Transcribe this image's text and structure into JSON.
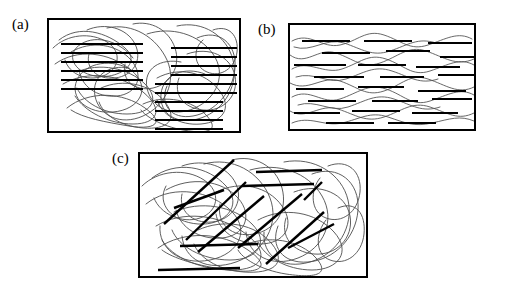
{
  "figure": {
    "background_color": "#ffffff",
    "matrix_color": "#4d4d4d",
    "fiber_color": "#000000",
    "frame_color": "#000000",
    "panels": [
      {
        "id": "a",
        "label": "(a)",
        "x": 47,
        "y": 18,
        "width": 194,
        "height": 115,
        "matrix_style": "random-coil",
        "fiber_style": "clustered-horizontal-bundles",
        "fiber_angle_deg": 0,
        "bundle_count": 3
      },
      {
        "id": "b",
        "label": "(b)",
        "x": 288,
        "y": 23,
        "width": 188,
        "height": 108,
        "matrix_style": "aligned-wavy",
        "fiber_style": "dispersed-horizontal-segments",
        "fiber_angle_deg": 0,
        "bundle_count": 0
      },
      {
        "id": "c",
        "label": "(c)",
        "x": 138,
        "y": 152,
        "width": 230,
        "height": 126,
        "matrix_style": "random-coil",
        "fiber_style": "randomly-oriented-segments",
        "fiber_angle_deg": null,
        "bundle_count": 0
      }
    ]
  },
  "chart_data": {
    "type": "diagram",
    "title": "",
    "panel_a": {
      "label": "(a)",
      "matrix_curves": [
        {
          "d": "M12,22 C32,6 60,14 78,30 C96,46 70,62 48,58 C26,54 18,36 34,26 C50,16 74,24 86,40"
        },
        {
          "d": "M8,46 C30,30 62,34 84,52 C106,70 92,92 66,94 C40,96 22,80 30,62 C38,44 66,40 84,52"
        },
        {
          "d": "M20,90 C42,72 76,74 98,90 C120,106 106,112 82,108 C58,104 36,100 24,92"
        },
        {
          "d": "M60,10 C86,4 110,20 120,42 C130,64 118,88 96,98 C74,108 52,98 48,78 C44,58 62,46 82,50"
        },
        {
          "d": "M100,16 C124,8 152,16 166,36 C180,56 170,80 148,90 C126,100 104,90 100,70 C96,50 114,40 134,44"
        },
        {
          "d": "M130,8 C156,2 180,18 186,42 C192,66 178,92 154,100 C130,108 112,96 114,76 C116,56 138,48 158,56"
        },
        {
          "d": "M150,20 C172,10 190,26 188,50 C186,74 168,94 146,98 C124,102 112,86 120,68"
        },
        {
          "d": "M16,66 C40,52 74,56 96,74 C118,92 110,106 86,106 C62,106 38,94 28,78"
        },
        {
          "d": "M86,6 C104,2 122,12 128,30 C134,48 124,66 106,70 C88,74 74,62 78,46"
        },
        {
          "d": "M40,12 C58,4 80,10 88,26 C96,42 86,58 68,60 C50,62 38,50 42,36"
        },
        {
          "d": "M110,60 C132,48 158,54 172,72 C186,90 176,104 154,106 C132,108 114,96 110,82"
        },
        {
          "d": "M24,34 C44,22 70,26 84,42 C98,58 90,76 70,78 C50,80 34,68 32,52"
        },
        {
          "d": "M140,36 C162,28 184,38 188,58 C192,78 176,94 156,92 C136,90 126,76 132,60"
        },
        {
          "d": "M54,70 C76,60 104,66 118,84 C132,102 120,112 96,110 C72,108 56,96 52,84"
        },
        {
          "d": "M6,30 C20,16 44,14 60,24 C76,34 72,52 56,58 C40,64 22,56 18,42"
        },
        {
          "d": "M96,86 C118,76 146,82 160,98 C174,114 158,116 136,112 C114,108 98,98 94,92"
        },
        {
          "d": "M166,12 C182,6 192,18 190,34 C188,50 174,60 160,54 C146,48 146,30 156,22"
        },
        {
          "d": "M30,54 C52,44 82,50 98,66 C114,82 104,96 80,96 C56,96 36,84 30,70"
        }
      ],
      "fiber_bundles": [
        {
          "x1": 14,
          "x2": 96,
          "y_start": 26,
          "y_step": 9,
          "count": 6,
          "note": "upper-left bundle"
        },
        {
          "x1": 108,
          "x2": 176,
          "y_start": 66,
          "y_step": 9,
          "count": 6,
          "note": "lower-center bundle"
        },
        {
          "x1": 124,
          "x2": 190,
          "y_start": 30,
          "y_step": 9,
          "count": 6,
          "note": "upper-right bundle"
        }
      ]
    },
    "panel_b": {
      "label": "(b)",
      "matrix_curves": [
        {
          "d": "M4,18 C22,8 34,26 52,22 C70,18 78,6 96,12 C114,18 122,28 140,22 C158,16 170,8 184,16"
        },
        {
          "d": "M2,32 C18,44 30,24 48,30 C66,36 74,46 92,40 C110,34 120,22 138,28 C156,34 168,44 186,36"
        },
        {
          "d": "M4,46 C20,36 36,52 54,46 C72,40 80,30 98,36 C116,42 124,54 142,48 C160,42 172,34 186,42"
        },
        {
          "d": "M2,60 C20,70 34,52 52,58 C70,64 78,74 96,68 C114,62 122,50 140,56 C158,62 170,72 186,64"
        },
        {
          "d": "M4,74 C22,64 34,82 52,76 C70,70 80,60 98,66 C116,72 124,84 142,78 C160,72 172,64 186,72"
        },
        {
          "d": "M2,88 C18,98 32,80 50,86 C68,92 78,100 96,94 C114,88 124,78 142,84 C160,90 170,98 186,90"
        },
        {
          "d": "M4,100 C22,92 36,104 54,100 C72,96 82,88 100,94 C118,100 126,104 144,100 C162,96 172,92 186,98"
        },
        {
          "d": "M6,24 C24,30 38,14 56,20 C74,26 84,34 102,28 C120,22 130,14 148,20"
        },
        {
          "d": "M8,54 C26,48 40,62 58,56 C76,50 86,42 104,48 C122,54 132,62 150,56"
        },
        {
          "d": "M10,82 C28,76 42,90 60,84 C78,78 88,70 106,76 C124,82 134,90 152,84"
        }
      ],
      "fibers": [
        {
          "x1": 14,
          "x2": 62,
          "y": 18
        },
        {
          "x1": 76,
          "x2": 124,
          "y": 18
        },
        {
          "x1": 140,
          "x2": 184,
          "y": 20
        },
        {
          "x1": 34,
          "x2": 82,
          "y": 30
        },
        {
          "x1": 98,
          "x2": 142,
          "y": 28
        },
        {
          "x1": 152,
          "x2": 186,
          "y": 34
        },
        {
          "x1": 6,
          "x2": 58,
          "y": 42
        },
        {
          "x1": 70,
          "x2": 118,
          "y": 42
        },
        {
          "x1": 128,
          "x2": 172,
          "y": 44
        },
        {
          "x1": 26,
          "x2": 76,
          "y": 54
        },
        {
          "x1": 92,
          "x2": 136,
          "y": 54
        },
        {
          "x1": 150,
          "x2": 186,
          "y": 52
        },
        {
          "x1": 8,
          "x2": 56,
          "y": 66
        },
        {
          "x1": 70,
          "x2": 116,
          "y": 64
        },
        {
          "x1": 130,
          "x2": 178,
          "y": 68
        },
        {
          "x1": 20,
          "x2": 68,
          "y": 78
        },
        {
          "x1": 84,
          "x2": 130,
          "y": 78
        },
        {
          "x1": 144,
          "x2": 184,
          "y": 76
        },
        {
          "x1": 6,
          "x2": 52,
          "y": 90
        },
        {
          "x1": 64,
          "x2": 112,
          "y": 88
        },
        {
          "x1": 124,
          "x2": 170,
          "y": 90
        },
        {
          "x1": 38,
          "x2": 86,
          "y": 100
        },
        {
          "x1": 100,
          "x2": 148,
          "y": 100
        }
      ]
    },
    "panel_c": {
      "label": "(c)",
      "matrix_curves": [
        {
          "d": "M14,26 C38,8 70,14 88,34 C106,54 86,74 60,72 C34,70 18,52 28,34"
        },
        {
          "d": "M8,52 C30,34 66,36 90,56 C114,76 102,102 72,108 C42,114 20,96 22,74"
        },
        {
          "d": "M20,96 C46,78 84,80 110,98 C136,116 120,122 90,118 C60,114 34,106 24,98"
        },
        {
          "d": "M66,12 C94,4 122,20 132,46 C142,72 126,100 98,110 C70,120 46,108 44,84"
        },
        {
          "d": "M112,18 C140,10 170,20 184,44 C198,68 186,96 160,106 C134,116 110,104 108,80"
        },
        {
          "d": "M146,10 C176,4 204,22 210,48 C216,74 200,102 172,110 C144,118 124,104 126,80"
        },
        {
          "d": "M174,22 C200,12 222,30 220,58 C218,86 196,108 170,110 C144,112 132,94 140,74"
        },
        {
          "d": "M18,74 C44,58 82,62 108,82 C134,102 124,118 94,118 C64,118 34,106 24,88"
        },
        {
          "d": "M94,8 C116,2 138,14 144,36 C150,58 138,78 116,82 C94,86 78,72 82,52"
        },
        {
          "d": "M44,14 C66,6 90,14 98,32 C106,50 94,68 74,70 C54,72 40,58 44,42"
        },
        {
          "d": "M120,68 C146,54 178,60 196,80 C214,100 200,118 174,118 C148,118 126,104 120,90"
        },
        {
          "d": "M28,38 C52,24 84,28 100,46 C116,64 106,84 84,86 C62,88 42,76 38,58"
        },
        {
          "d": "M156,40 C182,30 208,42 212,64 C216,86 198,104 176,102 C154,100 142,84 148,66"
        },
        {
          "d": "M60,78 C86,66 118,72 134,92 C150,112 134,122 106,120 C78,118 60,104 56,92"
        },
        {
          "d": "M4,34 C20,18 48,16 66,28 C84,40 80,60 62,66 C44,72 22,62 16,46"
        },
        {
          "d": "M104,94 C130,82 162,88 178,106 C194,124 174,126 148,122 C122,118 104,106 100,98"
        },
        {
          "d": "M190,14 C210,6 224,20 222,40 C220,60 204,72 188,66 C172,60 172,38 182,26"
        },
        {
          "d": "M36,60 C62,48 96,54 114,72 C132,90 120,108 92,108 C64,108 40,94 34,78"
        },
        {
          "d": "M200,56 C218,48 228,62 226,82 C224,102 208,114 192,108 C176,102 178,80 188,68"
        },
        {
          "d": "M78,40 C102,28 130,34 144,54 C158,74 146,92 122,92 C98,92 80,78 78,62"
        }
      ],
      "fibers": [
        {
          "x1": 26,
          "y1": 72,
          "x2": 96,
          "y2": 8,
          "note": "steep diagonal upper-left"
        },
        {
          "x1": 48,
          "y1": 88,
          "x2": 108,
          "y2": 30,
          "note": "diagonal"
        },
        {
          "x1": 36,
          "y1": 56,
          "x2": 86,
          "y2": 38,
          "note": "shallow diagonal"
        },
        {
          "x1": 60,
          "y1": 100,
          "x2": 126,
          "y2": 44,
          "note": "diagonal"
        },
        {
          "x1": 100,
          "y1": 96,
          "x2": 164,
          "y2": 42,
          "note": "diagonal center"
        },
        {
          "x1": 128,
          "y1": 112,
          "x2": 186,
          "y2": 60,
          "note": "diagonal lower-right"
        },
        {
          "x1": 118,
          "y1": 20,
          "x2": 184,
          "y2": 18,
          "note": "horizontal upper-right"
        },
        {
          "x1": 104,
          "y1": 34,
          "x2": 176,
          "y2": 32,
          "note": "horizontal upper-right"
        },
        {
          "x1": 42,
          "y1": 94,
          "x2": 120,
          "y2": 92,
          "note": "horizontal lower-left"
        },
        {
          "x1": 20,
          "y1": 118,
          "x2": 102,
          "y2": 116,
          "note": "horizontal bottom"
        },
        {
          "x1": 150,
          "y1": 96,
          "x2": 196,
          "y2": 72,
          "note": "short diagonal right"
        },
        {
          "x1": 166,
          "y1": 48,
          "x2": 184,
          "y2": 30,
          "note": "short diagonal right"
        }
      ]
    }
  }
}
